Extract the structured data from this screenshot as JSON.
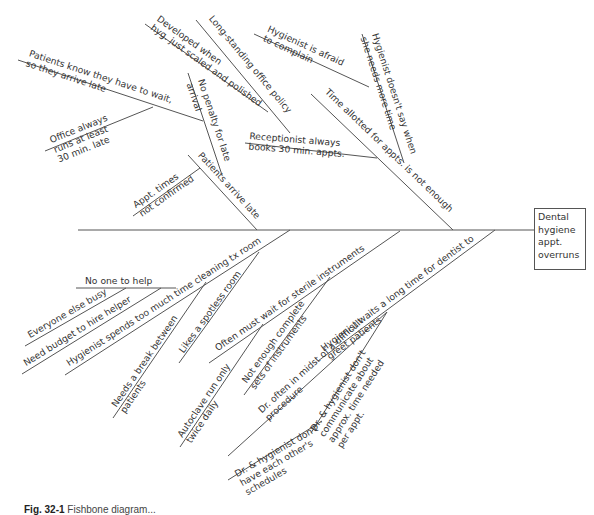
{
  "diagram": {
    "type": "fishbone",
    "effect": {
      "lines": [
        "Dental",
        "hygiene",
        "appt.",
        "overruns"
      ]
    },
    "caption": {
      "label": "Fig. 32-1",
      "text": "Fishbone diagram..."
    },
    "spine": {
      "x1": 78,
      "y1": 230,
      "x2": 534,
      "y2": 230
    },
    "bones": [
      {
        "id": "patients-arrive-late",
        "x1": 257,
        "y1": 230,
        "x2": 188,
        "y2": 155,
        "lines": [
          "Patients arrive late"
        ],
        "anchor": "top",
        "tx": 196,
        "ty": 157,
        "angle": 47.4
      },
      {
        "id": "no-penalty",
        "x1": 222,
        "y1": 175,
        "x2": 188,
        "y2": 73,
        "lines": [
          "No penalty for late",
          "arrival"
        ],
        "anchor": "top",
        "tx": 196,
        "ty": 81,
        "angle": 71.5,
        "dual": true
      },
      {
        "id": "patients-know-wait",
        "x1": 18,
        "y1": 60,
        "x2": 203,
        "y2": 121,
        "lines": [
          "Patients know they have to wait,",
          "so they arrive late"
        ],
        "anchor": "top",
        "tx": 28,
        "ty": 58,
        "angle": 18.2
      },
      {
        "id": "office-runs-late",
        "x1": 45,
        "y1": 151,
        "x2": 153,
        "y2": 107,
        "lines": [
          "Office always",
          "runs at least",
          "30 min. late"
        ],
        "anchor": "top",
        "tx": 52,
        "ty": 145,
        "angle": -22
      },
      {
        "id": "appt-times-not-confirmed",
        "x1": 133,
        "y1": 216,
        "x2": 200,
        "y2": 168,
        "lines": [
          "Appt. times",
          "not confirmed"
        ],
        "anchor": "top",
        "tx": 137,
        "ty": 210,
        "angle": -35
      },
      {
        "id": "developed-when",
        "x1": 145,
        "y1": 24,
        "x2": 268,
        "y2": 112,
        "lines": [
          "Developed when",
          "hyg. just scaled and polished"
        ],
        "anchor": "top",
        "tx": 155,
        "ty": 22,
        "angle": 35.5
      },
      {
        "id": "long-standing-policy",
        "x1": 196,
        "y1": 20,
        "x2": 290,
        "y2": 133,
        "lines": [
          "Long-standing office policy"
        ],
        "anchor": "top",
        "tx": 207,
        "ty": 20,
        "angle": 50.3
      },
      {
        "id": "receptionist-books",
        "x1": 245,
        "y1": 143,
        "x2": 377,
        "y2": 158,
        "lines": [
          "Receptionist always",
          "books 30 min. appts."
        ],
        "anchor": "top",
        "tx": 249,
        "ty": 141,
        "angle": 4.5
      },
      {
        "id": "time-allotted",
        "x1": 311,
        "y1": 94,
        "x2": 453,
        "y2": 230,
        "lines": [
          "Time allotted for appts. is not enough"
        ],
        "anchor": "top",
        "tx": 323,
        "ty": 94,
        "angle": 43.8
      },
      {
        "id": "hygienist-doesnt-say",
        "x1": 362,
        "y1": 34,
        "x2": 404,
        "y2": 163,
        "lines": [
          "Hygienist doesn't say when",
          "she needs more time"
        ],
        "anchor": "top",
        "tx": 370,
        "ty": 35,
        "angle": 72,
        "dual": true
      },
      {
        "id": "hygienist-afraid",
        "x1": 254,
        "y1": 34,
        "x2": 369,
        "y2": 87,
        "lines": [
          "Hygienist is afraid",
          "to complain"
        ],
        "anchor": "top",
        "tx": 266,
        "ty": 33,
        "angle": 24.8
      },
      {
        "id": "cleaning-tx-room",
        "x1": 290,
        "y1": 230,
        "x2": 65,
        "y2": 375,
        "lines": [
          "Hygienist spends too much time cleaning tx room"
        ],
        "anchor": "top",
        "tx": 70,
        "ty": 368,
        "angle": -32.8
      },
      {
        "id": "no-one-to-help",
        "x1": 76,
        "y1": 288,
        "x2": 176,
        "y2": 288,
        "lines": [
          "No one to help"
        ],
        "anchor": "top",
        "tx": 85,
        "ty": 286,
        "angle": 0
      },
      {
        "id": "everyone-busy",
        "x1": 25,
        "y1": 346,
        "x2": 126,
        "y2": 288,
        "lines": [
          "Everyone else busy"
        ],
        "anchor": "top",
        "tx": 31,
        "ty": 340,
        "angle": -30
      },
      {
        "id": "need-budget",
        "x1": 22,
        "y1": 374,
        "x2": 161,
        "y2": 288,
        "lines": [
          "Need budget to hire helper"
        ],
        "anchor": "top",
        "tx": 27,
        "ty": 368,
        "angle": -31.7
      },
      {
        "id": "needs-break",
        "x1": 113,
        "y1": 418,
        "x2": 206,
        "y2": 282,
        "lines": [
          "Needs a break between",
          "patients"
        ],
        "anchor": "top",
        "tx": 118,
        "ty": 409,
        "angle": -55.6
      },
      {
        "id": "spotless-room",
        "x1": 179,
        "y1": 363,
        "x2": 259,
        "y2": 252,
        "lines": [
          "Likes a spotless room"
        ],
        "anchor": "top",
        "tx": 185,
        "ty": 355,
        "angle": -54.2
      },
      {
        "id": "wait-sterile",
        "x1": 209,
        "y1": 363,
        "x2": 400,
        "y2": 231,
        "lines": [
          "Often must wait for sterile instruments"
        ],
        "anchor": "top",
        "tx": 219,
        "ty": 353,
        "angle": -34.6
      },
      {
        "id": "autoclave",
        "x1": 180,
        "y1": 447,
        "x2": 263,
        "y2": 324,
        "lines": [
          "Autoclave run only",
          "twice daily"
        ],
        "anchor": "top",
        "tx": 184,
        "ty": 439,
        "angle": -56
      },
      {
        "id": "not-enough-sets",
        "x1": 244,
        "y1": 395,
        "x2": 330,
        "y2": 277,
        "lines": [
          "Not enough complete",
          "sets of instruments"
        ],
        "anchor": "top",
        "tx": 248,
        "ty": 385,
        "angle": -54
      },
      {
        "id": "hygienist-waits",
        "x1": 318,
        "y1": 361,
        "x2": 495,
        "y2": 230,
        "lines": [
          "Hygienist waits a long time for dentist to",
          "greet patients"
        ],
        "anchor": "top",
        "tx": 325,
        "ty": 353,
        "angle": -36.5
      },
      {
        "id": "dr-difficult-procedure",
        "x1": 228,
        "y1": 456,
        "x2": 387,
        "y2": 312,
        "lines": [
          "Dr. often in midst of a difficult",
          "procedure"
        ],
        "anchor": "top",
        "tx": 263,
        "ty": 415,
        "angle": -42
      },
      {
        "id": "dr-schedules",
        "x1": 228,
        "y1": 480,
        "x2": 322,
        "y2": 421,
        "lines": [
          "Dr. & hygienist don't",
          "have each other's",
          "schedules"
        ],
        "anchor": "top",
        "tx": 238,
        "ty": 479,
        "angle": -30
      },
      {
        "id": "dr-communicate",
        "x1": 311,
        "y1": 433,
        "x2": 387,
        "y2": 312,
        "lines": [
          "Dr. & hygienist don't",
          "communicate about",
          "approx. time needed",
          "per appt."
        ],
        "anchor": "top",
        "tx": 317,
        "ty": 433,
        "angle": -57.5
      }
    ]
  }
}
